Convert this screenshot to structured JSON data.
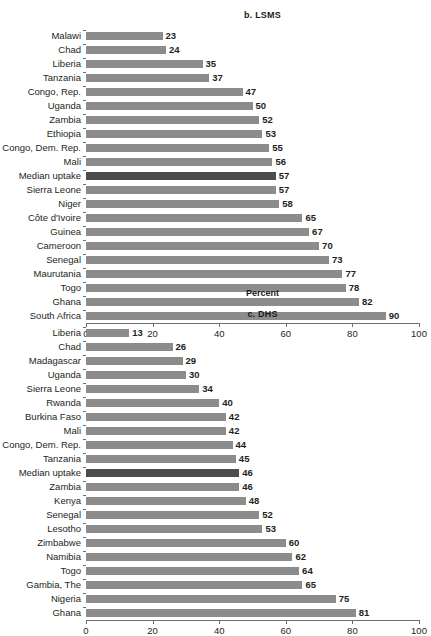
{
  "figure": {
    "background": "#ffffff",
    "bar_color": "#8c8c8c",
    "highlight_color": "#4d4d4d",
    "axis_color": "#6e6e6e"
  },
  "panel_b": {
    "title": "b. LSMS",
    "axis_title": "Percent"
  },
  "panel_c": {
    "title": "c. DHS",
    "axis_title": ""
  },
  "chart_data": [
    {
      "type": "bar",
      "orientation": "horizontal",
      "title": "b. LSMS",
      "xlabel": "Percent",
      "ylabel": "",
      "xlim": [
        0,
        100
      ],
      "xticks": [
        0,
        20,
        40,
        60,
        80,
        100
      ],
      "xticklabels": [
        "0",
        "20",
        "40",
        "60",
        "80",
        "100"
      ],
      "grid": false,
      "legend": "none",
      "highlight_category": "Median uptake",
      "categories": [
        "Malawi",
        "Chad",
        "Liberia",
        "Tanzania",
        "Congo, Rep.",
        "Uganda",
        "Zambia",
        "Ethiopia",
        "Congo, Dem. Rep.",
        "Mali",
        "Median uptake",
        "Sierra Leone",
        "Niger",
        "Côte d'Ivoire",
        "Guinea",
        "Cameroon",
        "Senegal",
        "Maurutania",
        "Togo",
        "Ghana",
        "South Africa"
      ],
      "values": [
        23,
        24,
        35,
        37,
        47,
        50,
        52,
        53,
        55,
        56,
        57,
        57,
        58,
        65,
        67,
        70,
        73,
        77,
        78,
        82,
        90
      ]
    },
    {
      "type": "bar",
      "orientation": "horizontal",
      "title": "c. DHS",
      "xlabel": "",
      "ylabel": "",
      "xlim": [
        0,
        100
      ],
      "xticks": [
        0,
        20,
        40,
        60,
        80,
        100
      ],
      "xticklabels": [
        "0",
        "20",
        "40",
        "60",
        "80",
        "100"
      ],
      "grid": false,
      "legend": "none",
      "highlight_category": "Median uptake",
      "categories": [
        "Liberia",
        "Chad",
        "Madagascar",
        "Uganda",
        "Sierra Leone",
        "Rwanda",
        "Burkina Faso",
        "Mali",
        "Congo, Dem. Rep.",
        "Tanzania",
        "Median uptake",
        "Zambia",
        "Kenya",
        "Senegal",
        "Lesotho",
        "Zimbabwe",
        "Namibia",
        "Togo",
        "Gambia, The",
        "Nigeria",
        "Ghana"
      ],
      "values": [
        13,
        26,
        29,
        30,
        34,
        40,
        42,
        42,
        44,
        45,
        46,
        46,
        48,
        52,
        53,
        60,
        62,
        64,
        65,
        75,
        81
      ]
    }
  ]
}
